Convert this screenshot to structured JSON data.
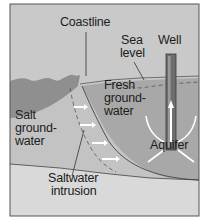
{
  "labels": {
    "coastline": "Coastline",
    "sea_level_1": "Sea",
    "sea_level_2": "level",
    "well": "Well",
    "fresh_1": "Fresh",
    "fresh_2": "ground-",
    "fresh_3": "water",
    "salt_1": "Salt",
    "salt_2": "ground-",
    "salt_3": "water",
    "aquifer": "Aquifer",
    "intrusion_1": "Saltwater",
    "intrusion_2": "intrusion"
  },
  "colors": {
    "sky": "#c9c9c9",
    "sea": "#8e8e8e",
    "fresh_water": "#a9a9a9",
    "salt_ground": "#c4c4c4",
    "bedrock": "#d8d8d8",
    "well_pipe": "#6e6e6e",
    "frame": "#555555",
    "arrow": "#ffffff"
  }
}
